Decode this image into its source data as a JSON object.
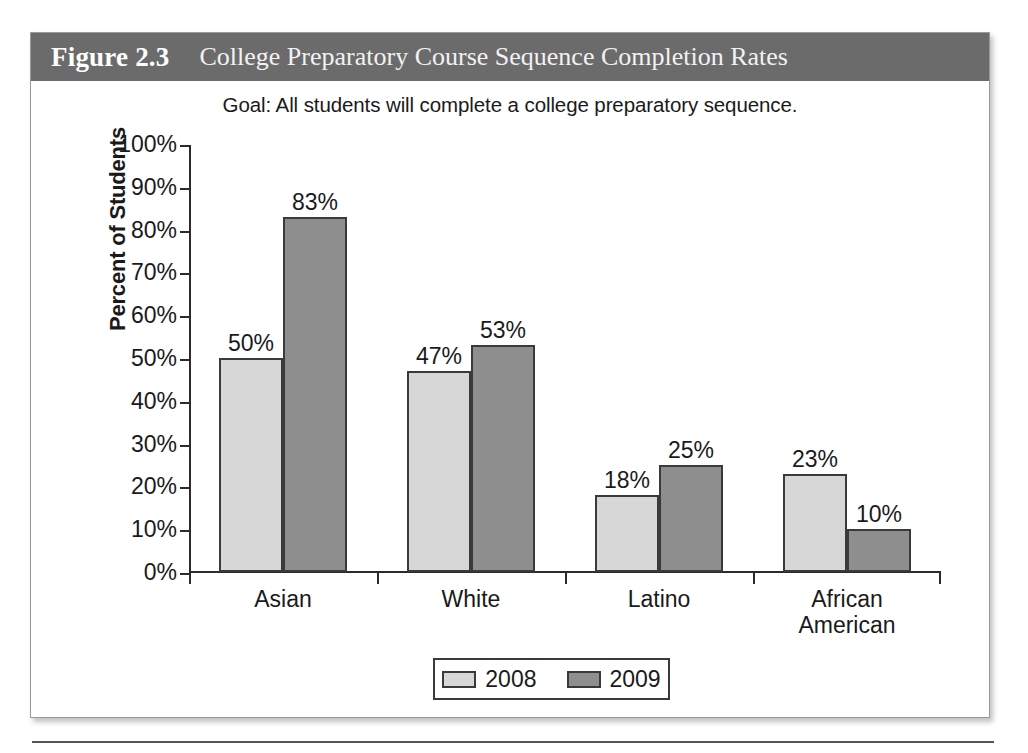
{
  "figure": {
    "number": "Figure 2.3",
    "title": "College Preparatory Course Sequence Completion Rates",
    "header_bg": "#6b6b6b",
    "header_text_color": "#ffffff"
  },
  "chart_data": {
    "type": "bar",
    "title": "Goal: All students will complete a college preparatory sequence.",
    "xlabel": "",
    "ylabel": "Percent of Students",
    "ylim": [
      0,
      100
    ],
    "ytick_labels": [
      "100%",
      "90%",
      "80%",
      "70%",
      "60%",
      "50%",
      "40%",
      "30%",
      "20%",
      "10%",
      "0%"
    ],
    "ytick_values": [
      100,
      90,
      80,
      70,
      60,
      50,
      40,
      30,
      20,
      10,
      0
    ],
    "grid": false,
    "legend_position": "bottom-center",
    "categories": [
      "Asian",
      "White",
      "Latino",
      "African\nAmerican"
    ],
    "category_lines": [
      [
        "Asian"
      ],
      [
        "White"
      ],
      [
        "Latino"
      ],
      [
        "African",
        "American"
      ]
    ],
    "series": [
      {
        "name": "2008",
        "color": "#d7d7d7",
        "values": [
          50,
          47,
          18,
          23
        ],
        "labels": [
          "50%",
          "47%",
          "18%",
          "23%"
        ]
      },
      {
        "name": "2009",
        "color": "#8e8e8e",
        "values": [
          83,
          53,
          25,
          10
        ],
        "labels": [
          "83%",
          "53%",
          "25%",
          "10%"
        ]
      }
    ]
  },
  "legend": {
    "items": [
      {
        "label": "2008",
        "color": "#d7d7d7"
      },
      {
        "label": "2009",
        "color": "#8e8e8e"
      }
    ]
  }
}
